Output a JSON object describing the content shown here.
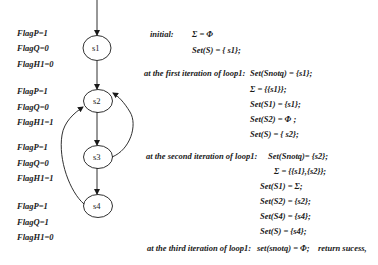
{
  "graph": {
    "nodes": [
      {
        "id": "s1",
        "label": "s1"
      },
      {
        "id": "s2",
        "label": "s2"
      },
      {
        "id": "s3",
        "label": "s3"
      },
      {
        "id": "s4",
        "label": "s4"
      }
    ],
    "edges": [
      {
        "from": "entry",
        "to": "s1"
      },
      {
        "from": "s1",
        "to": "s2"
      },
      {
        "from": "s2",
        "to": "s3"
      },
      {
        "from": "s3",
        "to": "s4"
      },
      {
        "from": "s3",
        "to": "s2"
      },
      {
        "from": "s4",
        "to": "s2"
      }
    ]
  },
  "flags": [
    {
      "node": "s1",
      "lines": [
        "FlagP=1",
        "FlagQ=0",
        "FlagH1=0"
      ]
    },
    {
      "node": "s2",
      "lines": [
        "FlagP=1",
        "FlagQ=0",
        "FlagH1=1"
      ]
    },
    {
      "node": "s3",
      "lines": [
        "FlagP=1",
        "FlagQ=0",
        "FlagH1=1"
      ]
    },
    {
      "node": "s4",
      "lines": [
        "FlagP=1",
        "FlagQ=1",
        "FlagH1=0"
      ]
    }
  ],
  "trace": {
    "initial": {
      "label": "initial:",
      "lines": [
        "Σ = Φ",
        "Set(S) = { s1};"
      ]
    },
    "iter1": {
      "label": "at the first iteration of loop1:",
      "lines": [
        "Set(Snotq) = {s1};",
        "Σ =  {{s1}};",
        "Set(S1) = {s1};",
        "Set(S2) = Φ ;",
        "Set(S) = { s2};"
      ]
    },
    "iter2": {
      "label": "at the second iteration of loop1:",
      "lines": [
        "Set(Snotq)= {s2};",
        "Σ = {{s1},{s2}};",
        "Set(S1) = Σ;",
        "Set(S2) = {s2};",
        "Set(S4) = {s4};",
        "Set(S) = {s4};"
      ]
    },
    "iter3": {
      "label": "at the third iteration of loop1:",
      "lines": [
        "set(snotq) = Φ;",
        "return sucess,"
      ]
    }
  }
}
